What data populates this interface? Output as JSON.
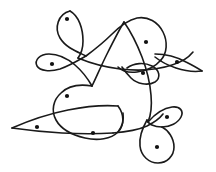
{
  "figure": {
    "kind": "line-drawing",
    "width": 216,
    "height": 172,
    "background_color": "#ffffff",
    "stroke_color": "#1a1a1a",
    "dot_color": "#111111",
    "stroke_width": 1.6,
    "dot_radius": 2.1,
    "region_count": 11,
    "curve_count": 4
  },
  "curves": [
    {
      "name": "upper-left-lobe-curve",
      "description": "Long stroke beginning at the narrow top-left teardrop tip, sweeping down through the central lattice and out to the right edge",
      "path": "M 73 9 C 60 10 53 22 57 33 C 61 44 75 51 88 55 C 101 59 116 62 130 64 C 144 66 160 66 172 62 C 183 58 190 50 193 44"
    },
    {
      "name": "left-teardrop-curve",
      "description": "Teardrop loop on the upper-left that narrows to a point at top",
      "path": "M 73 9 C 84 13 89 27 89 40 C 89 53 82 63 71 69 C 60 75 48 76 41 71 C 34 66 35 57 43 53"
    },
    {
      "name": "right-dome-curve",
      "description": "Dome over the right side, descending into the small right-hand eyelet",
      "path": "M 121 58 C 118 40 128 26 142 23 C 156 20 167 31 170 45 C 173 59 166 70 154 73"
    },
    {
      "name": "lower-sweep-curve",
      "description": "Broad sweep across the lower half ending in the paired bottom-right loops",
      "path": "M 12 128 C 40 118 72 112 101 114 C 130 116 152 124 163 136"
    }
  ],
  "regions": [
    {
      "name": "region-top-left-teardrop",
      "label": "1",
      "x": 67,
      "y": 19
    },
    {
      "name": "region-left-eyelet",
      "label": "2",
      "x": 52,
      "y": 68
    },
    {
      "name": "region-top-right-dome",
      "label": "3",
      "x": 146,
      "y": 42
    },
    {
      "name": "region-right-eyelet",
      "label": "4",
      "x": 175,
      "y": 62
    },
    {
      "name": "region-center-right-eyelet",
      "label": "5",
      "x": 143,
      "y": 72
    },
    {
      "name": "region-center-left-lobe",
      "label": "6",
      "x": 67,
      "y": 96
    },
    {
      "name": "region-far-left-point",
      "label": "7",
      "x": 37,
      "y": 127
    },
    {
      "name": "region-bottom-center-lobe",
      "label": "8",
      "x": 93,
      "y": 133
    },
    {
      "name": "region-bottom-right-eyelet",
      "label": "9",
      "x": 167,
      "y": 118
    },
    {
      "name": "region-bottom-right-loop",
      "label": "10",
      "x": 157,
      "y": 147
    },
    {
      "name": "region-upper-center",
      "label": "11",
      "x": 110,
      "y": 30
    }
  ]
}
